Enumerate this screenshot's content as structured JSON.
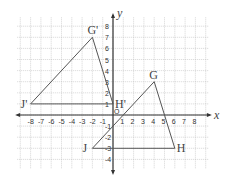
{
  "axes": {
    "x_label": "x",
    "y_label": "y",
    "origin_label": "O",
    "x_ticks": [
      "-8",
      "-7",
      "-6",
      "-5",
      "-4",
      "-3",
      "-2",
      "-1",
      "1",
      "2",
      "3",
      "4",
      "5",
      "6",
      "7",
      "8"
    ],
    "y_ticks": [
      "8",
      "7",
      "6",
      "5",
      "4",
      "3",
      "2",
      "1",
      "-1",
      "-2",
      "-3",
      "-4"
    ]
  },
  "triangles": [
    {
      "name": "GHJ",
      "vertices": [
        {
          "label": "G",
          "x": 4,
          "y": 3
        },
        {
          "label": "H",
          "x": 6,
          "y": -3
        },
        {
          "label": "J",
          "x": -2,
          "y": -3
        }
      ]
    },
    {
      "name": "G'H'J'",
      "vertices": [
        {
          "label": "G'",
          "x": -2,
          "y": 7
        },
        {
          "label": "H'",
          "x": 0,
          "y": 1
        },
        {
          "label": "J'",
          "x": -8,
          "y": 1
        }
      ]
    }
  ],
  "colors": {
    "line": "#555555",
    "grid": "#bbbbbb"
  }
}
